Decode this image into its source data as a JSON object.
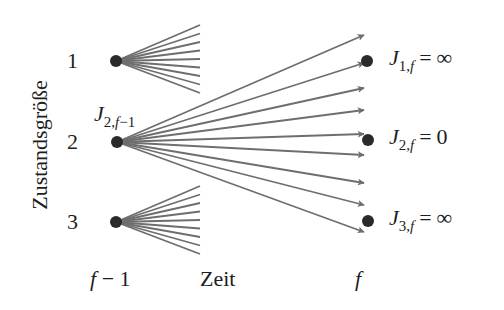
{
  "diagram": {
    "colors": {
      "node": "#2a2a2a",
      "edge": "#6e6e6e",
      "text": "#1e1e1e",
      "background": "#ffffff"
    },
    "y_axis_label": "Zustandsgröße",
    "x_axis_label": "Zeit",
    "stage_left_label": {
      "main": "f",
      "rest": " − 1"
    },
    "stage_right_label": "f",
    "left_states": [
      {
        "id": 1,
        "label": "1",
        "x": 116,
        "y": 61
      },
      {
        "id": 2,
        "label": "2",
        "x": 117,
        "y": 142
      },
      {
        "id": 3,
        "label": "3",
        "x": 116,
        "y": 222
      }
    ],
    "left_node_cost_label": {
      "state": 2,
      "symbol": "J",
      "subscript_index": "2,",
      "subscript_stage": "f",
      "subscript_rest": "−1"
    },
    "right_states": [
      {
        "id": 1,
        "x": 367,
        "y": 61,
        "symbol": "J",
        "sub_index": "1,",
        "sub_stage": "f",
        "eq": "=",
        "value": "∞"
      },
      {
        "id": 2,
        "x": 368,
        "y": 140,
        "symbol": "J",
        "sub_index": "2,",
        "sub_stage": "f",
        "eq": "=",
        "value": "0"
      },
      {
        "id": 3,
        "x": 368,
        "y": 221,
        "symbol": "J",
        "sub_index": "3,",
        "sub_stage": "f",
        "eq": "=",
        "value": "∞"
      }
    ],
    "fans": {
      "state_1": {
        "origin": [
          116,
          61
        ],
        "end_x": 200,
        "end_ys": [
          25,
          33.5,
          42,
          50.5,
          59,
          67.5,
          76,
          84.5,
          93
        ]
      },
      "state_3": {
        "origin": [
          116,
          222
        ],
        "end_x": 200,
        "end_ys": [
          186,
          194.5,
          203,
          211.5,
          220,
          228.5,
          237,
          245.5,
          254
        ]
      }
    },
    "arrows_from_state_2": {
      "origin": [
        117,
        142
      ],
      "count": 9,
      "tips": [
        [
          364,
          35
        ],
        [
          364,
          63
        ],
        [
          364,
          88
        ],
        [
          364,
          110
        ],
        [
          364,
          134
        ],
        [
          364,
          155
        ],
        [
          364,
          183
        ],
        [
          364,
          205
        ],
        [
          364,
          232
        ]
      ]
    }
  }
}
